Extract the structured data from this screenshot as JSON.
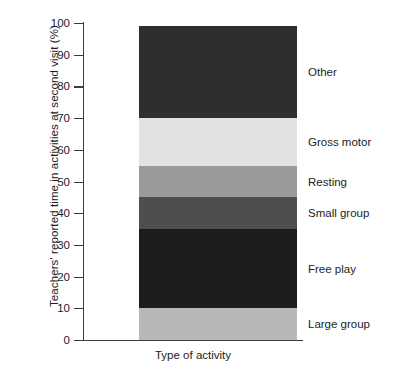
{
  "chart_data": {
    "type": "bar",
    "subtype": "stacked-bar-single-category",
    "title": "",
    "xlabel": "Type of activity",
    "ylabel": "Teachers' reported time in activities at second visit (%)",
    "ylim": [
      0,
      100
    ],
    "grid": false,
    "legend_position": "right-of-bar-inline-labels",
    "categories": [
      "Type of activity"
    ],
    "y_ticks": [
      0,
      10,
      20,
      30,
      40,
      50,
      60,
      70,
      80,
      90,
      100
    ],
    "y_tick_labels": [
      "0",
      "10",
      "20",
      "30",
      "40",
      "50",
      "60",
      "70",
      "80",
      "90",
      "100"
    ],
    "series": [
      {
        "name": "Large group",
        "values": [
          10
        ],
        "start": 0,
        "end": 10,
        "color": "#b8b8b8"
      },
      {
        "name": "Free play",
        "values": [
          25
        ],
        "start": 10,
        "end": 35,
        "color": "#1c1c1c"
      },
      {
        "name": "Small group",
        "values": [
          10
        ],
        "start": 35,
        "end": 45,
        "color": "#4e4e4e"
      },
      {
        "name": "Resting",
        "values": [
          10
        ],
        "start": 45,
        "end": 55,
        "color": "#9a9a9a"
      },
      {
        "name": "Gross motor",
        "values": [
          15
        ],
        "start": 55,
        "end": 70,
        "color": "#e2e2e2"
      },
      {
        "name": "Other",
        "values": [
          29
        ],
        "start": 70,
        "end": 99,
        "color": "#2e2e2e"
      }
    ],
    "total": 99
  },
  "axes": {
    "y_title": "Teachers' reported time in activities at second visit (%)",
    "x_title": "Type of activity",
    "ticks": [
      {
        "label": "100"
      },
      {
        "label": "90"
      },
      {
        "label": "80"
      },
      {
        "label": "70"
      },
      {
        "label": "60"
      },
      {
        "label": "50"
      },
      {
        "label": "40"
      },
      {
        "label": "30"
      },
      {
        "label": "20"
      },
      {
        "label": "10"
      },
      {
        "label": "0"
      }
    ]
  },
  "segments": [
    {
      "label": "Other"
    },
    {
      "label": "Gross motor"
    },
    {
      "label": "Resting"
    },
    {
      "label": "Small group"
    },
    {
      "label": "Free play"
    },
    {
      "label": "Large group"
    }
  ]
}
